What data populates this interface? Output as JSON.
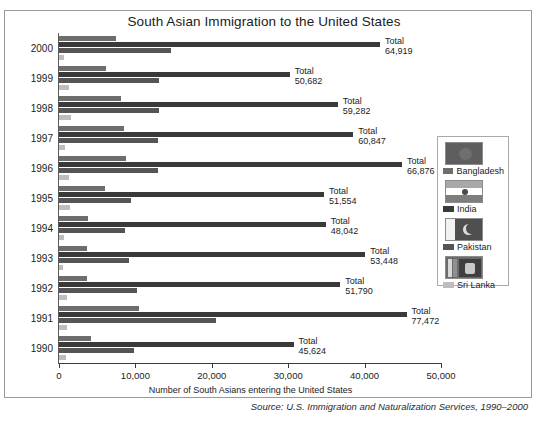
{
  "chart_data": {
    "type": "bar",
    "orientation": "horizontal",
    "title": "South Asian Immigration to the United States",
    "xlabel": "Number of South Asians entering the United States",
    "ylabel": "Years of entry",
    "xlim": [
      0,
      50000
    ],
    "xticks": [
      0,
      10000,
      20000,
      30000,
      40000,
      50000
    ],
    "xticklabels": [
      "0",
      "10,000",
      "20,000",
      "30,000",
      "40,000",
      "50,000"
    ],
    "grid": false,
    "legend_position": "right",
    "categories": [
      "2000",
      "1999",
      "1998",
      "1997",
      "1996",
      "1995",
      "1994",
      "1993",
      "1992",
      "1991",
      "1990"
    ],
    "series": [
      {
        "name": "Bangladesh",
        "color": "#6d6d6d",
        "values": [
          7500,
          6100,
          8100,
          8500,
          8800,
          6000,
          3800,
          3600,
          3700,
          10500,
          4200
        ]
      },
      {
        "name": "India",
        "color": "#3a3a3a",
        "values": [
          42000,
          30200,
          36500,
          38500,
          44900,
          34700,
          34900,
          40100,
          36800,
          45500,
          30700
        ]
      },
      {
        "name": "Pakistan",
        "color": "#555555",
        "values": [
          14700,
          13100,
          13100,
          13000,
          12900,
          9400,
          8700,
          9200,
          10200,
          20500,
          9800
        ]
      },
      {
        "name": "Sri Lanka",
        "color": "#bdbdbd",
        "values": [
          700,
          1250,
          1550,
          850,
          1250,
          1450,
          650,
          550,
          1100,
          1000,
          900
        ]
      }
    ],
    "totals": [
      {
        "year": "2000",
        "label": "Total",
        "value": "64,919"
      },
      {
        "year": "1999",
        "label": "Total",
        "value": "50,682"
      },
      {
        "year": "1998",
        "label": "Total",
        "value": "59,282"
      },
      {
        "year": "1997",
        "label": "Total",
        "value": "60,847"
      },
      {
        "year": "1996",
        "label": "Total",
        "value": "66,876"
      },
      {
        "year": "1995",
        "label": "Total",
        "value": "51,554"
      },
      {
        "year": "1994",
        "label": "Total",
        "value": "48,042"
      },
      {
        "year": "1993",
        "label": "Total",
        "value": "53,448"
      },
      {
        "year": "1992",
        "label": "Total",
        "value": "51,790"
      },
      {
        "year": "1991",
        "label": "Total",
        "value": "77,472"
      },
      {
        "year": "1990",
        "label": "Total",
        "value": "45,624"
      }
    ],
    "source": "Source: U.S. Immigration and Naturalization Services, 1990–2000"
  },
  "legend": {
    "entries": [
      {
        "label": "Bangladesh",
        "flag": "bangladesh-flag-icon",
        "color": "#6d6d6d"
      },
      {
        "label": "India",
        "flag": "india-flag-icon",
        "color": "#3a3a3a"
      },
      {
        "label": "Pakistan",
        "flag": "pakistan-flag-icon",
        "color": "#555555"
      },
      {
        "label": "Sri Lanka",
        "flag": "sri-lanka-flag-icon",
        "color": "#bdbdbd"
      }
    ]
  }
}
